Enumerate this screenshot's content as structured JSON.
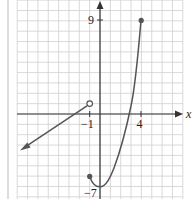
{
  "chart_data": {
    "type": "line",
    "title": "",
    "xlabel": "x",
    "ylabel": "",
    "x_tick_labels": [
      "-1",
      "4"
    ],
    "y_tick_labels": [
      "9",
      "-7"
    ],
    "xlim": [
      -8,
      8
    ],
    "ylim": [
      -8,
      10
    ],
    "grid": true,
    "series": [
      {
        "name": "linear piece",
        "kind": "line",
        "points": [
          [
            -7,
            -3
          ],
          [
            -1,
            1
          ]
        ],
        "start": "arrow",
        "end": "open-circle",
        "color": "#555555"
      },
      {
        "name": "curved piece",
        "kind": "curve",
        "points": [
          [
            -1,
            -6
          ],
          [
            -0.5,
            -6.8
          ],
          [
            0,
            -7
          ],
          [
            0.5,
            -6.8
          ],
          [
            1,
            -6
          ],
          [
            2,
            -3
          ],
          [
            3,
            2
          ],
          [
            4,
            9
          ]
        ],
        "start": "closed-circle",
        "end": "closed-circle",
        "color": "#555555"
      }
    ],
    "key_points": {
      "open": [
        [
          -1,
          1
        ]
      ],
      "closed": [
        [
          -1,
          -6
        ],
        [
          4,
          9
        ]
      ],
      "minimum": [
        0,
        -7
      ]
    }
  },
  "labels": {
    "x_axis": "x",
    "tick_neg1": "−1",
    "tick_4": "4",
    "tick_9": "9",
    "tick_neg7": "−7"
  }
}
